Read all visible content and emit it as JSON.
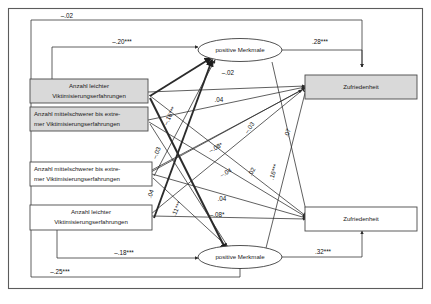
{
  "figure": {
    "frame_color": "#5c5c5c",
    "shaded_fill": "#d9d9d9",
    "plain_fill": "#ffffff",
    "line_color": "#2b2b2b"
  },
  "nodes": [
    {
      "id": "t1_leicht",
      "type": "box-shaded",
      "label_line1": "Anzahl leichter",
      "label_line2": "Viktimisierungserfahrungen"
    },
    {
      "id": "t1_schwer",
      "type": "box-shaded",
      "label_line1": "Anzahl mittelschwerer bis extre-",
      "label_line2": "mer Viktimisierungserfahrungen"
    },
    {
      "id": "t2_schwer",
      "type": "box-plain",
      "label_line1": "Anzahl mittelschwerer bis extre-",
      "label_line2": "mer Viktimisierungserfahrungen"
    },
    {
      "id": "t2_leicht",
      "type": "box-plain",
      "label_line1": "Anzahl leichter",
      "label_line2": "Viktimisierungserfahrungen"
    },
    {
      "id": "pm_top",
      "type": "ellipse",
      "label_line1": "positive Merkmale",
      "label_line2": ""
    },
    {
      "id": "pm_bottom",
      "type": "ellipse",
      "label_line1": "positive Merkmale",
      "label_line2": ""
    },
    {
      "id": "zuf_top",
      "type": "box-shaded",
      "label_line1": "Zufriedenheit",
      "label_line2": ""
    },
    {
      "id": "zuf_bottom",
      "type": "box-plain",
      "label_line1": "Zufriedenheit",
      "label_line2": ""
    }
  ],
  "paths": [
    {
      "id": "p01",
      "coefficient": "–.02",
      "from": "t1_schwer",
      "to": "zuf_top"
    },
    {
      "id": "p02",
      "coefficient": "–.20***",
      "from": "t1_leicht",
      "to": "pm_top"
    },
    {
      "id": "p03",
      "coefficient": ".28***",
      "from": "pm_top",
      "to": "zuf_top"
    },
    {
      "id": "p04",
      "coefficient": "–.02",
      "from": "t1_leicht",
      "to": "zuf_top"
    },
    {
      "id": "p05",
      "coefficient": ".04",
      "from": "t1_schwer",
      "to": "zuf_top"
    },
    {
      "id": "p06",
      "coefficient": "–.03",
      "from": "t2_leicht",
      "to": "zuf_top"
    },
    {
      "id": "p07",
      "coefficient": ".07",
      "from": "pm_bottom",
      "to": "zuf_top"
    },
    {
      "id": "p08",
      "coefficient": "–.08*",
      "from": "t2_schwer",
      "to": "zuf_top"
    },
    {
      "id": "p09",
      "coefficient": "–.04",
      "from": "t2_schwer",
      "to": "zuf_bottom"
    },
    {
      "id": "p10",
      "coefficient": ".04",
      "from": "t2_schwer",
      "to": "zuf_bottom"
    },
    {
      "id": "p11",
      "coefficient": "–.08*",
      "from": "t2_leicht",
      "to": "zuf_bottom"
    },
    {
      "id": "p12",
      "coefficient": "–.18***",
      "from": "t2_leicht",
      "to": "pm_bottom"
    },
    {
      "id": "p13",
      "coefficient": ".32***",
      "from": "pm_bottom",
      "to": "zuf_bottom"
    },
    {
      "id": "p14",
      "coefficient": "–.25***",
      "from": "t1_schwer",
      "to": "pm_bottom"
    },
    {
      "id": "p15",
      "coefficient": "–.16***",
      "from": "t1_leicht",
      "to": "pm_top",
      "rotated": true
    },
    {
      "id": "p16",
      "coefficient": ".16***",
      "from": "t1_leicht",
      "to": "zuf_bottom",
      "rotated": true
    },
    {
      "id": "p17",
      "coefficient": ".02",
      "from": "t2_schwer",
      "to": "zuf_top",
      "rotated": true
    },
    {
      "id": "p18",
      "coefficient": ".11***",
      "from": "t2_leicht",
      "to": "pm_bottom",
      "rotated": true
    },
    {
      "id": "p19",
      "coefficient": "–.03",
      "from": "t1_schwer",
      "to": "pm_bottom",
      "rotated": true
    },
    {
      "id": "p20",
      "coefficient": ".04",
      "from": "t1_leicht",
      "to": "pm_bottom",
      "rotated": true
    }
  ],
  "labels": {
    "c_neg02_top": "–.02",
    "c_neg20": "–.20***",
    "c_28": ".28***",
    "c_neg02_mid": "–.02",
    "c_04_upper": ".04",
    "c_neg03": "–.03",
    "c_07": ".07",
    "c_neg08_upper": "–.08*",
    "c_neg04": "–.04",
    "c_02": ".02",
    "c_16": ".16***",
    "c_neg16": "–.16***",
    "c_04_lower": ".04",
    "c_neg08_lower": "–.08*",
    "c_11": ".11***",
    "c_neg18": "–.18***",
    "c_32": ".32***",
    "c_neg25": "–.25***",
    "c_neg03_rot": "–.03",
    "c_04_rot": ".04"
  }
}
